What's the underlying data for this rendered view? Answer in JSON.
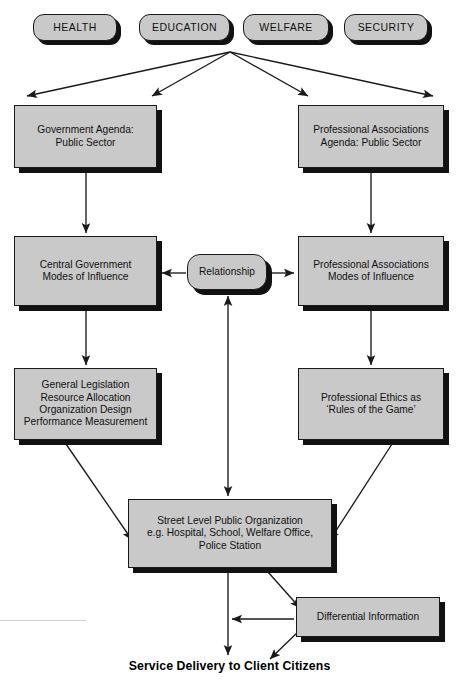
{
  "diagram": {
    "title": "Service Delivery to Client Citizens",
    "footer_caption": "Service Delivery to Client Citizens",
    "colors": {
      "node_fill": "#c9c9c9",
      "node_border": "#1a1a1a",
      "shadow": "#111111",
      "text": "#111111",
      "background": "#ffffff",
      "edge": "#1a1a1a"
    },
    "sectors": [
      {
        "id": "health",
        "label": "HEALTH"
      },
      {
        "id": "education",
        "label": "EDUCATION"
      },
      {
        "id": "welfare",
        "label": "WELFARE"
      },
      {
        "id": "security",
        "label": "SECURITY"
      }
    ],
    "nodes": [
      {
        "id": "government-agenda",
        "label": "Government Agenda:\nPublic Sector"
      },
      {
        "id": "professional-associations-agenda",
        "label": "Professional Associations\nAgenda: Public Sector"
      },
      {
        "id": "central-government-modes",
        "label": "Central Government\nModes of Influence"
      },
      {
        "id": "relationship",
        "label": "Relationship"
      },
      {
        "id": "professional-associations-modes",
        "label": "Professional Associations\nModes of Influence"
      },
      {
        "id": "general-legislation",
        "label": "General Legislation\nResource Allocation\nOrganization Design\nPerformance Measurement"
      },
      {
        "id": "professional-ethics",
        "label": "Professional Ethics as\n‘Rules of the Game’"
      },
      {
        "id": "street-level-public-organization",
        "label": "Street Level Public Organization\ne.g. Hospital, School, Welfare Office,\nPolice Station"
      },
      {
        "id": "differential-information",
        "label": "Differential Information"
      }
    ]
  }
}
